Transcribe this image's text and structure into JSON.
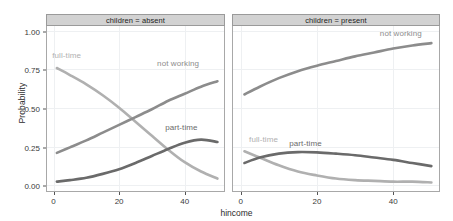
{
  "chart_data": {
    "type": "line",
    "title": "",
    "xlabel": "hincome",
    "ylabel": "Probability",
    "xlim": [
      -2,
      52
    ],
    "ylim": [
      -0.03,
      1.03
    ],
    "xticks": [
      0,
      20,
      40
    ],
    "xtick_labels": [
      "0",
      "20",
      "40"
    ],
    "yticks": [
      0.0,
      0.25,
      0.5,
      0.75,
      1.0
    ],
    "ytick_labels": [
      "0.00",
      "0.25",
      "0.50",
      "0.75",
      "1.00"
    ],
    "grid": true,
    "legend_position": "inline-labels",
    "facet_variable": "children",
    "panels": [
      {
        "strip_label": "children = absent",
        "series": [
          {
            "name": "full-time",
            "color": "#b0b0b0",
            "label": "full-time",
            "label_x": 4,
            "label_y": 0.845,
            "x": [
              1,
              5,
              10,
              15,
              20,
              25,
              30,
              35,
              40,
              45,
              50
            ],
            "y": [
              0.76,
              0.715,
              0.655,
              0.585,
              0.505,
              0.415,
              0.325,
              0.235,
              0.155,
              0.095,
              0.05
            ]
          },
          {
            "name": "not working",
            "color": "#8c8c8c",
            "label": "not working",
            "label_x": 38,
            "label_y": 0.79,
            "x": [
              1,
              5,
              10,
              15,
              20,
              25,
              30,
              35,
              40,
              45,
              50
            ],
            "y": [
              0.215,
              0.25,
              0.295,
              0.345,
              0.395,
              0.445,
              0.495,
              0.55,
              0.595,
              0.64,
              0.675
            ]
          },
          {
            "name": "part-time",
            "color": "#6a6a6a",
            "label": "part-time",
            "label_x": 39,
            "label_y": 0.375,
            "x": [
              1,
              5,
              10,
              15,
              20,
              25,
              30,
              35,
              40,
              45,
              50
            ],
            "y": [
              0.03,
              0.04,
              0.055,
              0.08,
              0.11,
              0.15,
              0.195,
              0.24,
              0.28,
              0.3,
              0.285
            ]
          }
        ]
      },
      {
        "strip_label": "children = present",
        "series": [
          {
            "name": "not working",
            "color": "#8c8c8c",
            "label": "not working",
            "label_x": 42,
            "label_y": 0.985,
            "x": [
              1,
              5,
              10,
              15,
              20,
              25,
              30,
              35,
              40,
              45,
              50
            ],
            "y": [
              0.59,
              0.64,
              0.695,
              0.74,
              0.775,
              0.805,
              0.835,
              0.86,
              0.885,
              0.905,
              0.92
            ]
          },
          {
            "name": "full-time",
            "color": "#b0b0b0",
            "label": "full-time",
            "label_x": 6,
            "label_y": 0.3,
            "x": [
              1,
              5,
              10,
              15,
              20,
              25,
              30,
              35,
              40,
              45,
              50
            ],
            "y": [
              0.225,
              0.185,
              0.135,
              0.095,
              0.07,
              0.05,
              0.04,
              0.035,
              0.03,
              0.03,
              0.025
            ]
          },
          {
            "name": "part-time",
            "color": "#6a6a6a",
            "label": "part-time",
            "label_x": 17,
            "label_y": 0.275,
            "x": [
              1,
              5,
              10,
              15,
              20,
              25,
              30,
              35,
              40,
              45,
              50
            ],
            "y": [
              0.15,
              0.185,
              0.21,
              0.22,
              0.218,
              0.21,
              0.2,
              0.185,
              0.17,
              0.15,
              0.13
            ]
          }
        ]
      }
    ]
  }
}
